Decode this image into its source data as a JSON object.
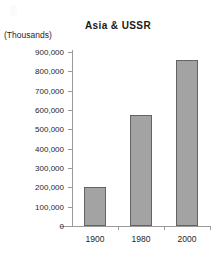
{
  "chart_data": {
    "type": "bar",
    "title": "Asia & USSR",
    "ylabel": "(Thousands)",
    "xlabel": "",
    "categories": [
      "1900",
      "1980",
      "2000"
    ],
    "values": [
      200000,
      575000,
      860000
    ],
    "ylim": [
      0,
      900000
    ],
    "ytick_labels": [
      "900,000",
      "800,000",
      "700,000",
      "600,000",
      "500,000",
      "400,000",
      "300,000",
      "200,000",
      "100,000",
      "0"
    ],
    "ytick_values": [
      900000,
      800000,
      700000,
      600000,
      500000,
      400000,
      300000,
      200000,
      100000,
      0
    ],
    "grid": false,
    "legend": null,
    "bar_color": "#a3a3a3",
    "bar_border_color": "#636363",
    "axis_color": "#9a9a9a",
    "text_color": "#262626"
  }
}
